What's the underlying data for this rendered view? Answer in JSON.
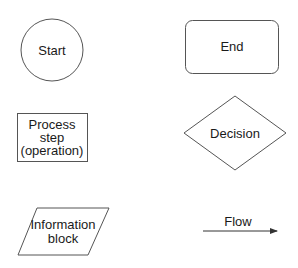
{
  "diagram": {
    "type": "flowchart-legend",
    "stroke_color": "#555555",
    "text_color": "#1a1a1a",
    "shapes": {
      "start": {
        "shape": "circle",
        "label": "Start"
      },
      "end": {
        "shape": "rounded-rectangle",
        "label": "End"
      },
      "process": {
        "shape": "rectangle",
        "label_lines": [
          "Process",
          "step",
          "(operation)"
        ]
      },
      "decision": {
        "shape": "diamond",
        "label": "Decision"
      },
      "information": {
        "shape": "parallelogram",
        "label_lines": [
          "Information",
          "block"
        ]
      },
      "flow": {
        "shape": "arrow",
        "label": "Flow"
      }
    }
  }
}
